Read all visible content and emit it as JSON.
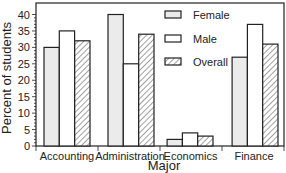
{
  "chart_data": {
    "type": "bar",
    "title": "",
    "xlabel": "Major",
    "ylabel": "Percent of students",
    "ylim": [
      0,
      43.5
    ],
    "yticks": [
      0,
      5,
      10,
      15,
      20,
      25,
      30,
      35,
      40
    ],
    "ytick_labels": [
      "0",
      "5",
      "10",
      "15",
      "20",
      "25",
      "30",
      "35",
      "40"
    ],
    "minor_tick_step": 1,
    "grid": false,
    "legend_position": "top-right",
    "categories": [
      "Accounting",
      "Administration",
      "Economics",
      "Finance"
    ],
    "series": [
      {
        "name": "Female",
        "values": [
          30,
          40,
          2,
          27
        ],
        "fill": "#ebebeb",
        "pattern": "solid"
      },
      {
        "name": "Male",
        "values": [
          35,
          25,
          4,
          37
        ],
        "fill": "#ffffff",
        "pattern": "solid"
      },
      {
        "name": "Overall",
        "values": [
          32,
          34,
          3,
          31
        ],
        "fill": "#ffffff",
        "pattern": "diagonal-hatch"
      }
    ]
  }
}
